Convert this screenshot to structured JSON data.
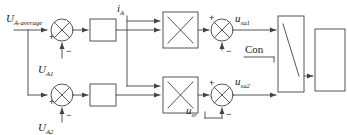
{
  "diagram": {
    "stroke_color": "#555555",
    "text_color": "#1a1a1a",
    "background": "#ffffff"
  },
  "signals": {
    "reference": {
      "base": "U",
      "sub": "A-average",
      "full": "U_A-average"
    },
    "feedback_a1": {
      "base": "U",
      "sub": "A1",
      "full": "U_A1"
    },
    "feedback_a2": {
      "base": "U",
      "sub": "A2",
      "full": "U_A2"
    },
    "current": {
      "base": "i",
      "sub": "A",
      "full": "i_A"
    },
    "out_top": {
      "base": "u",
      "sub": "sa1",
      "full": "u_sa1"
    },
    "out_bottom": {
      "base": "u",
      "sub": "sa2",
      "full": "u_sa2"
    },
    "sum_bottom_input": {
      "base": "u",
      "sub": "sr",
      "full": "u_sr"
    },
    "control": {
      "base": "Con",
      "sub": "",
      "full": "Con"
    }
  },
  "signs": {
    "top_sum_plus": "+",
    "top_sum_minus": "−",
    "bottom_sum_plus": "+",
    "bottom_sum_minus": "−",
    "top_out_plus": "+",
    "top_out_minus": "−",
    "bottom_out_plus": "+",
    "bottom_out_minus": "−"
  },
  "blocks": {
    "gain_top": {
      "name": "gain-block-top",
      "label": ""
    },
    "gain_bottom": {
      "name": "gain-block-bottom",
      "label": ""
    },
    "multiplier_top": {
      "name": "multiplier-top",
      "glyph": "×"
    },
    "multiplier_bottom": {
      "name": "multiplier-bottom",
      "glyph": "×"
    },
    "comparator": {
      "name": "comparator-block",
      "label": ""
    },
    "output": {
      "name": "output-block",
      "label": ""
    }
  }
}
